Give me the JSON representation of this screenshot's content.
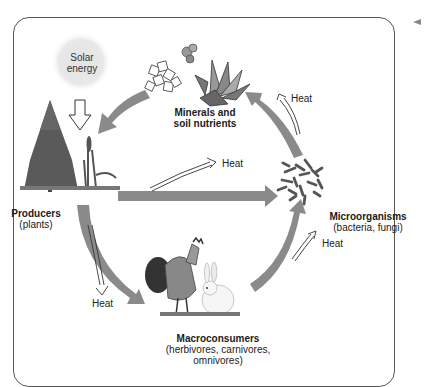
{
  "diagram": {
    "type": "nutrient and energy cycle",
    "nodes": {
      "solar": {
        "label_line1": "Solar",
        "label_line2": "energy"
      },
      "minerals": {
        "title_line1": "Minerals and",
        "title_line2": "soil nutrients"
      },
      "producers": {
        "title": "Producers",
        "subtitle": "(plants)"
      },
      "microorganisms": {
        "title": "Microorganisms",
        "subtitle": "(bacteria, fungi)"
      },
      "macroconsumers": {
        "title": "Macroconsumers",
        "subtitle_line1": "(herbivores, carnivores,",
        "subtitle_line2": "omnivores)"
      }
    },
    "heat_labels": {
      "producers_to_micro": "Heat",
      "micro_to_minerals": "Heat",
      "producers_to_macro": "Heat",
      "macro_to_micro": "Heat"
    },
    "edges": [
      {
        "from": "Solar energy",
        "to": "Producers",
        "style": "outline arrow"
      },
      {
        "from": "Minerals and soil nutrients",
        "to": "Producers",
        "style": "gray arrow"
      },
      {
        "from": "Producers",
        "to": "Microorganisms",
        "style": "gray arrow"
      },
      {
        "from": "Producers",
        "to": "Macroconsumers",
        "style": "gray arrow"
      },
      {
        "from": "Macroconsumers",
        "to": "Microorganisms",
        "style": "gray arrow"
      },
      {
        "from": "Microorganisms",
        "to": "Minerals and soil nutrients",
        "style": "gray arrow"
      }
    ],
    "colors": {
      "arrow": "#8a8a8a",
      "sun": "#e6e6e6",
      "frame": "#555555"
    }
  }
}
